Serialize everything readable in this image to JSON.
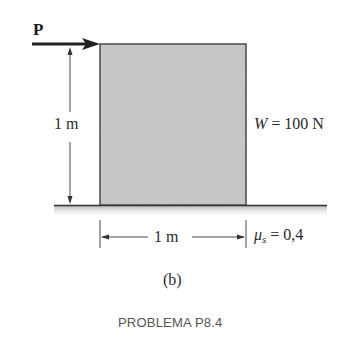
{
  "diagram": {
    "type": "statics-friction-block",
    "force": {
      "label": "P",
      "direction": "right",
      "applied_at": "top-left corner of block"
    },
    "block": {
      "fill_color": "#c8c8c8",
      "edge_color": "#333333"
    },
    "dimensions": {
      "height_label": "1 m",
      "width_label": "1 m"
    },
    "weight": {
      "symbol": "W",
      "equals": " = 100 N",
      "full_text": "W = 100 N"
    },
    "friction": {
      "symbol": "μ",
      "subscript": "s",
      "equals": " = 0,4",
      "full_text": "μs = 0,4"
    },
    "ground": {
      "line_color": "#333333",
      "shade_color": "#bdbdbd"
    },
    "subfigure_label": "(b)",
    "caption": "PROBLEMA P8.4"
  }
}
